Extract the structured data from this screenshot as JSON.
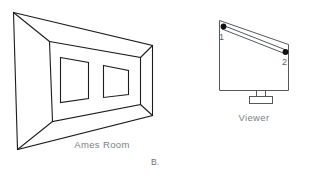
{
  "figure": {
    "panel_label": "B.",
    "background_color": "#ffffff",
    "line_color": "#1d1d1d",
    "text_color": "#7b7f82",
    "dot_color": "#111111"
  },
  "ames_room": {
    "caption": "Ames Room",
    "description": "trapezoidal room interior with two windows on the back wall",
    "windows": [
      {
        "name": "left-window"
      },
      {
        "name": "right-window"
      }
    ]
  },
  "viewer_diagram": {
    "caption": "Viewer",
    "points": [
      {
        "label": "1",
        "name": "point-one"
      },
      {
        "label": "2",
        "name": "point-two"
      }
    ],
    "stand_name": "viewer-stand"
  }
}
